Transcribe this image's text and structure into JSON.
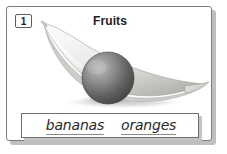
{
  "worksheet": {
    "item_number": "1",
    "title": "Fruits",
    "illustration": {
      "name": "banana-and-orange-illustration",
      "objects": [
        "banana",
        "orange"
      ],
      "style": "grayscale-shaded-drawing"
    },
    "answer_box": {
      "words": [
        {
          "text": "bananas",
          "name": "word-bananas"
        },
        {
          "text": "oranges",
          "name": "word-oranges"
        }
      ]
    }
  },
  "colors": {
    "page_background": "#ffffff",
    "card_border": "#7c7c7c",
    "card_shadow": "#bfbfbf",
    "title_text": "#232323",
    "word_text": "#2a2a2a",
    "underline": "#8a8a8a",
    "banana_light": "#f2f2f0",
    "banana_mid": "#d6d6d2",
    "banana_dark": "#a9a9a5",
    "orange_light": "#b6b6b6",
    "orange_dark": "#4a4a4a",
    "ground_shadow": "#c9c9c9"
  }
}
